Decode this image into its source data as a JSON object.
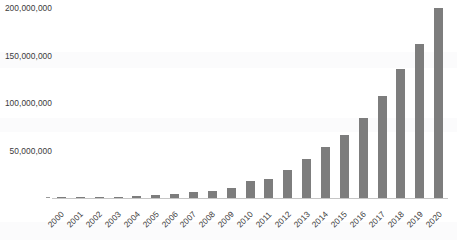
{
  "chart_data": {
    "type": "bar",
    "title": "",
    "xlabel": "",
    "ylabel": "",
    "ylim": [
      0,
      200000000
    ],
    "grid": false,
    "legend": null,
    "bar_color": "#7d7d7d",
    "background_color": "#ffffff",
    "y_ticks": [
      "50,000,000",
      "100,000,000",
      "150,000,000",
      "200,000,000"
    ],
    "y_tick_values": [
      50000000,
      100000000,
      150000000,
      200000000
    ],
    "categories": [
      "2000",
      "2001",
      "2002",
      "2003",
      "2004",
      "2005",
      "2006",
      "2007",
      "2008",
      "2009",
      "2010",
      "2011",
      "2012",
      "2013",
      "2014",
      "2015",
      "2016",
      "2017",
      "2018",
      "2019",
      "2020"
    ],
    "values": [
      200000,
      400000,
      700000,
      1300000,
      2200000,
      3300000,
      4700000,
      6200000,
      7800000,
      10500000,
      17500000,
      20500000,
      29500000,
      41000000,
      53500000,
      66000000,
      84000000,
      107000000,
      136000000,
      162000000,
      199500000
    ]
  }
}
